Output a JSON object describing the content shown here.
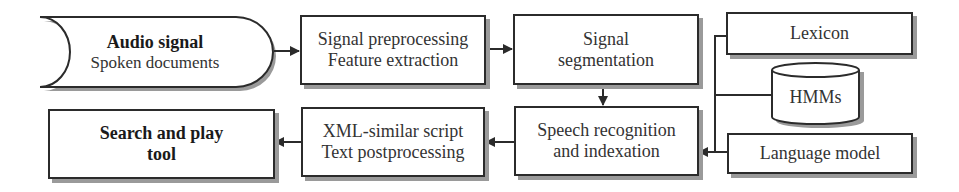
{
  "diagram": {
    "nodes": {
      "audio": {
        "title": "Audio signal",
        "subtitle": "Spoken documents",
        "shape": "stored-data"
      },
      "preprocessing": {
        "line1": "Signal preprocessing",
        "line2": "Feature extraction"
      },
      "segmentation": {
        "line1": "Signal",
        "line2": "segmentation"
      },
      "lexicon": {
        "label": "Lexicon"
      },
      "hmms": {
        "label": "HMMs",
        "shape": "cylinder"
      },
      "language_model": {
        "label": "Language model"
      },
      "recognition": {
        "line1": "Speech recognition",
        "line2": "and indexation"
      },
      "postprocessing": {
        "line1": "XML-similar script",
        "line2": "Text postprocessing"
      },
      "search": {
        "line1": "Search and play",
        "line2": "tool"
      }
    },
    "edges": [
      {
        "from": "Audio signal",
        "to": "Signal preprocessing"
      },
      {
        "from": "Signal preprocessing",
        "to": "Signal segmentation"
      },
      {
        "from": "Signal segmentation",
        "to": "Speech recognition"
      },
      {
        "from": "Lexicon",
        "to": "Speech recognition"
      },
      {
        "from": "HMMs",
        "to": "Speech recognition"
      },
      {
        "from": "Language model",
        "to": "Speech recognition"
      },
      {
        "from": "Speech recognition",
        "to": "XML-similar script"
      },
      {
        "from": "XML-similar script",
        "to": "Search and play tool"
      }
    ],
    "colors": {
      "stroke": "#2b2b2b",
      "shadow": "#9a9a9a",
      "background": "#ffffff"
    }
  }
}
